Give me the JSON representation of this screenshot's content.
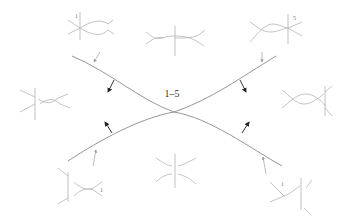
{
  "diagram": {
    "center_label": "1–5",
    "center_label_position": [
      172,
      97
    ],
    "main_curves": {
      "upper": "two arcs meeting at a tangency point at center (174,112)",
      "stroke_color": "#8a8a8a"
    },
    "normal_arrows": [
      {
        "id": "upper-left",
        "direction": "down-left"
      },
      {
        "id": "upper-right",
        "direction": "down-right"
      },
      {
        "id": "lower-left",
        "direction": "up-left"
      },
      {
        "id": "lower-right",
        "direction": "up-right"
      }
    ],
    "insets": [
      {
        "id": "top-left",
        "label": "1",
        "description": "braid crossing with vertical strand at left, arrows to right"
      },
      {
        "id": "top-center",
        "label": "",
        "description": "two crossings with vertical strand at center"
      },
      {
        "id": "top-right",
        "label": "5",
        "description": "braid crossing with vertical strand at right, arrows to right"
      },
      {
        "id": "middle-left",
        "label": "",
        "description": "vertical strand left of a crossing"
      },
      {
        "id": "middle-right",
        "label": "",
        "description": "crossing with vertical strand to its right"
      },
      {
        "id": "bottom-left",
        "label": "1",
        "description": "tangency with vertical strand at left"
      },
      {
        "id": "bottom-center",
        "label": "",
        "description": "two tangent arcs split by vertical strand"
      },
      {
        "id": "bottom-right",
        "label": "1",
        "description": "tangency with vertical strand at right"
      }
    ],
    "colors": {
      "main_curve": "#8a8a8a",
      "inset_stroke": "#b5b5b5",
      "arrow": "#222222",
      "label": "#333333"
    }
  }
}
